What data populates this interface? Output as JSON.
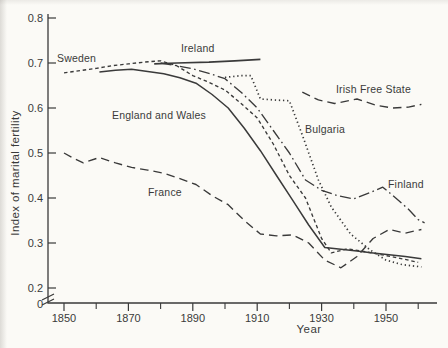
{
  "figure": {
    "paper_color": "#fbfaf6",
    "ink_color": "#3a3a3a",
    "width": 448,
    "height": 348
  },
  "chart_data": {
    "type": "line",
    "title": "",
    "xlabel": "Year",
    "ylabel": "Index of marital fertility",
    "xlim": [
      1845,
      1966
    ],
    "ylim_shown": [
      0.2,
      0.8
    ],
    "y_axis_break_between": [
      0,
      0.2
    ],
    "grid": false,
    "legend": "inline-labels",
    "x_ticks": [
      {
        "label": "1850",
        "value": 1850
      },
      {
        "label": "1870",
        "value": 1870
      },
      {
        "label": "1890",
        "value": 1890
      },
      {
        "label": "1910",
        "value": 1910
      },
      {
        "label": "1930",
        "value": 1930
      },
      {
        "label": "1950",
        "value": 1950
      }
    ],
    "x_ticks_minor": [
      1860,
      1880,
      1900,
      1920,
      1940,
      1960
    ],
    "y_ticks": [
      {
        "label": "0.8",
        "value": 0.8,
        "at_origin": false
      },
      {
        "label": "0.7",
        "value": 0.7,
        "at_origin": false
      },
      {
        "label": "0.6",
        "value": 0.6,
        "at_origin": false
      },
      {
        "label": "0.5",
        "value": 0.5,
        "at_origin": false
      },
      {
        "label": "0.4",
        "value": 0.4,
        "at_origin": false
      },
      {
        "label": "0.3",
        "value": 0.3,
        "at_origin": false
      },
      {
        "label": "0.2",
        "value": 0.2,
        "at_origin": false
      },
      {
        "label": "0",
        "value": 0,
        "at_origin": true
      }
    ],
    "series": [
      {
        "name": "Sweden",
        "style": "dash-short",
        "label": {
          "text": "Sweden",
          "x": 57,
          "y": 62
        },
        "points": [
          [
            1850,
            0.678
          ],
          [
            1855,
            0.683
          ],
          [
            1860,
            0.688
          ],
          [
            1865,
            0.694
          ],
          [
            1870,
            0.698
          ],
          [
            1875,
            0.702
          ],
          [
            1880,
            0.705
          ],
          [
            1885,
            0.694
          ],
          [
            1890,
            0.672
          ],
          [
            1895,
            0.657
          ],
          [
            1900,
            0.64
          ],
          [
            1905,
            0.61
          ],
          [
            1910,
            0.578
          ],
          [
            1915,
            0.52
          ],
          [
            1920,
            0.45
          ],
          [
            1925,
            0.4
          ],
          [
            1930,
            0.31
          ],
          [
            1933,
            0.278
          ],
          [
            1938,
            0.287
          ],
          [
            1944,
            0.28
          ],
          [
            1950,
            0.272
          ],
          [
            1955,
            0.265
          ],
          [
            1960,
            0.257
          ]
        ]
      },
      {
        "name": "Ireland",
        "style": "solid",
        "label": {
          "text": "Ireland",
          "x": 181,
          "y": 52
        },
        "points": [
          [
            1878,
            0.698
          ],
          [
            1885,
            0.7
          ],
          [
            1895,
            0.702
          ],
          [
            1903,
            0.705
          ],
          [
            1911,
            0.708
          ]
        ]
      },
      {
        "name": "England and Wales",
        "style": "solid",
        "label": {
          "text": "England and Wales",
          "x": 112,
          "y": 119
        },
        "points": [
          [
            1861,
            0.68
          ],
          [
            1866,
            0.684
          ],
          [
            1871,
            0.686
          ],
          [
            1876,
            0.681
          ],
          [
            1881,
            0.676
          ],
          [
            1886,
            0.667
          ],
          [
            1891,
            0.655
          ],
          [
            1896,
            0.63
          ],
          [
            1901,
            0.6
          ],
          [
            1906,
            0.555
          ],
          [
            1911,
            0.505
          ],
          [
            1916,
            0.45
          ],
          [
            1921,
            0.395
          ],
          [
            1926,
            0.34
          ],
          [
            1931,
            0.29
          ],
          [
            1936,
            0.286
          ],
          [
            1941,
            0.282
          ],
          [
            1946,
            0.278
          ],
          [
            1951,
            0.274
          ],
          [
            1956,
            0.27
          ],
          [
            1961,
            0.265
          ]
        ]
      },
      {
        "name": "France",
        "style": "dash-long",
        "label": {
          "text": "France",
          "x": 148,
          "y": 196
        },
        "points": [
          [
            1850,
            0.5
          ],
          [
            1853,
            0.488
          ],
          [
            1856,
            0.478
          ],
          [
            1861,
            0.49
          ],
          [
            1866,
            0.478
          ],
          [
            1871,
            0.468
          ],
          [
            1876,
            0.462
          ],
          [
            1881,
            0.455
          ],
          [
            1886,
            0.443
          ],
          [
            1891,
            0.43
          ],
          [
            1896,
            0.405
          ],
          [
            1901,
            0.385
          ],
          [
            1906,
            0.35
          ],
          [
            1911,
            0.32
          ],
          [
            1916,
            0.316
          ],
          [
            1921,
            0.318
          ],
          [
            1926,
            0.3
          ],
          [
            1931,
            0.262
          ],
          [
            1936,
            0.245
          ],
          [
            1941,
            0.27
          ],
          [
            1946,
            0.31
          ],
          [
            1951,
            0.33
          ],
          [
            1956,
            0.322
          ],
          [
            1961,
            0.33
          ]
        ]
      },
      {
        "name": "Bulgaria",
        "style": "dot",
        "label": {
          "text": "Bulgaria",
          "x": 305,
          "y": 133
        },
        "points": [
          [
            1900,
            0.668
          ],
          [
            1905,
            0.672
          ],
          [
            1908,
            0.672
          ],
          [
            1911,
            0.62
          ],
          [
            1915,
            0.618
          ],
          [
            1920,
            0.616
          ],
          [
            1924,
            0.54
          ],
          [
            1929,
            0.44
          ],
          [
            1933,
            0.38
          ],
          [
            1939,
            0.32
          ],
          [
            1945,
            0.285
          ],
          [
            1950,
            0.262
          ],
          [
            1955,
            0.252
          ],
          [
            1961,
            0.247
          ]
        ]
      },
      {
        "name": "Irish Free State",
        "style": "dash-long",
        "label": {
          "text": "Irish Free State",
          "x": 336,
          "y": 93
        },
        "points": [
          [
            1924,
            0.635
          ],
          [
            1929,
            0.618
          ],
          [
            1934,
            0.61
          ],
          [
            1941,
            0.62
          ],
          [
            1947,
            0.606
          ],
          [
            1952,
            0.6
          ],
          [
            1957,
            0.602
          ],
          [
            1961,
            0.608
          ]
        ]
      },
      {
        "name": "Finland",
        "style": "dash-dot",
        "label": {
          "text": "Finland",
          "x": 388,
          "y": 188
        },
        "points": [
          [
            1880,
            0.7
          ],
          [
            1885,
            0.694
          ],
          [
            1890,
            0.687
          ],
          [
            1895,
            0.677
          ],
          [
            1900,
            0.665
          ],
          [
            1905,
            0.635
          ],
          [
            1910,
            0.6
          ],
          [
            1915,
            0.55
          ],
          [
            1920,
            0.5
          ],
          [
            1925,
            0.44
          ],
          [
            1930,
            0.417
          ],
          [
            1935,
            0.405
          ],
          [
            1940,
            0.398
          ],
          [
            1945,
            0.412
          ],
          [
            1949,
            0.424
          ],
          [
            1953,
            0.4
          ],
          [
            1957,
            0.375
          ],
          [
            1960,
            0.352
          ],
          [
            1962,
            0.345
          ]
        ]
      }
    ]
  }
}
